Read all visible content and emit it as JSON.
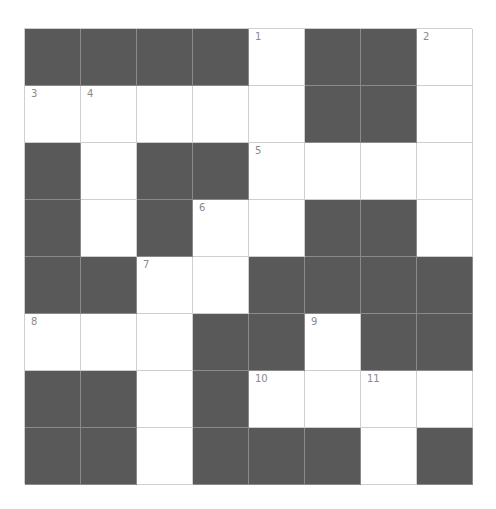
{
  "puzzle": {
    "rows": 8,
    "cols": 8,
    "colors": {
      "block": "#595959",
      "open": "#ffffff",
      "gridline": "#cfcfcf",
      "number": "#8a8a8a"
    },
    "grid": [
      [
        "B",
        "B",
        "B",
        "B",
        "W",
        "B",
        "B",
        "W"
      ],
      [
        "W",
        "W",
        "W",
        "W",
        "W",
        "B",
        "B",
        "W"
      ],
      [
        "B",
        "W",
        "B",
        "B",
        "W",
        "W",
        "W",
        "W"
      ],
      [
        "B",
        "W",
        "B",
        "W",
        "W",
        "B",
        "B",
        "W"
      ],
      [
        "B",
        "B",
        "W",
        "W",
        "B",
        "B",
        "B",
        "B"
      ],
      [
        "W",
        "W",
        "W",
        "B",
        "B",
        "W",
        "B",
        "B"
      ],
      [
        "B",
        "B",
        "W",
        "B",
        "W",
        "W",
        "W",
        "W"
      ],
      [
        "B",
        "B",
        "W",
        "B",
        "B",
        "B",
        "W",
        "B"
      ]
    ],
    "numbers": [
      [
        "",
        "",
        "",
        "",
        "1",
        "",
        "",
        "2"
      ],
      [
        "3",
        "4",
        "",
        "",
        "",
        "",
        "",
        ""
      ],
      [
        "",
        "",
        "",
        "",
        "5",
        "",
        "",
        ""
      ],
      [
        "",
        "",
        "",
        "6",
        "",
        "",
        "",
        ""
      ],
      [
        "",
        "",
        "7",
        "",
        "",
        "",
        "",
        ""
      ],
      [
        "8",
        "",
        "",
        "",
        "",
        "9",
        "",
        ""
      ],
      [
        "",
        "",
        "",
        "",
        "10",
        "",
        "11",
        ""
      ],
      [
        "",
        "",
        "",
        "",
        "",
        "",
        "",
        ""
      ]
    ]
  }
}
